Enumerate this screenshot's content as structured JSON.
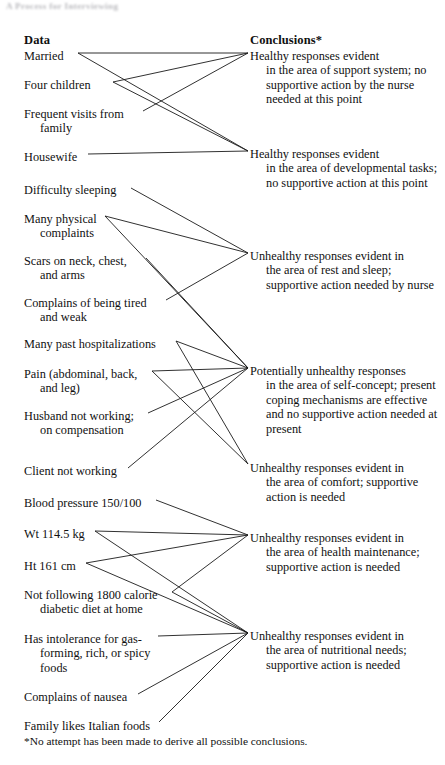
{
  "page": {
    "faded_running_head": "A Process for Interviewing",
    "footnote": "*No attempt has been made to derive all possible conclusions."
  },
  "headers": {
    "data": "Data",
    "conclusions": "Conclusions*"
  },
  "data_items": [
    {
      "id": "married",
      "line1": "Married",
      "cont": "",
      "y": 49,
      "anchor_x": 78,
      "anchor_y": 53
    },
    {
      "id": "four-children",
      "line1": "Four children",
      "cont": "",
      "y": 78,
      "anchor_x": 113,
      "anchor_y": 82
    },
    {
      "id": "frequent-visits",
      "line1": "Frequent visits from",
      "cont": "family",
      "y": 107,
      "anchor_x": 143,
      "anchor_y": 111
    },
    {
      "id": "housewife",
      "line1": "Housewife",
      "cont": "",
      "y": 150,
      "anchor_x": 88,
      "anchor_y": 154
    },
    {
      "id": "difficulty-sleeping",
      "line1": "Difficulty sleeping",
      "cont": "",
      "y": 183,
      "anchor_x": 131,
      "anchor_y": 188
    },
    {
      "id": "many-physical",
      "line1": "Many physical",
      "cont": "complaints",
      "y": 212,
      "anchor_x": 105,
      "anchor_y": 216
    },
    {
      "id": "scars",
      "line1": "Scars on neck, chest,",
      "cont": "and arms",
      "y": 254,
      "anchor_x": 146,
      "anchor_y": 258
    },
    {
      "id": "tired-weak",
      "line1": "Complains of being tired",
      "cont": "and weak",
      "y": 296,
      "anchor_x": 166,
      "anchor_y": 300
    },
    {
      "id": "hospitalizations",
      "line1": "Many past hospitalizations",
      "cont": "",
      "y": 337,
      "anchor_x": 176,
      "anchor_y": 341
    },
    {
      "id": "pain",
      "line1": "Pain (abdominal, back,",
      "cont": "and leg)",
      "y": 367,
      "anchor_x": 152,
      "anchor_y": 371
    },
    {
      "id": "husband-not-working",
      "line1": "Husband not working;",
      "cont": "on compensation",
      "y": 409,
      "anchor_x": 148,
      "anchor_y": 413
    },
    {
      "id": "client-not-working",
      "line1": "Client not working",
      "cont": "",
      "y": 464,
      "anchor_x": 128,
      "anchor_y": 468
    },
    {
      "id": "blood-pressure",
      "line1": "Blood pressure 150/100",
      "cont": "",
      "y": 496,
      "anchor_x": 156,
      "anchor_y": 500
    },
    {
      "id": "weight",
      "line1": "Wt 114.5 kg",
      "cont": "",
      "y": 527,
      "anchor_x": 95,
      "anchor_y": 531
    },
    {
      "id": "height",
      "line1": "Ht 161 cm",
      "cont": "",
      "y": 559,
      "anchor_x": 86,
      "anchor_y": 563
    },
    {
      "id": "diabetic-diet",
      "line1": "Not following 1800 calorie",
      "cont": "diabetic diet at home",
      "y": 588,
      "anchor_x": 172,
      "anchor_y": 592
    },
    {
      "id": "gas-intolerance",
      "line1": "Has intolerance for gas-",
      "cont": "forming, rich, or spicy\nfoods",
      "y": 632,
      "anchor_x": 158,
      "anchor_y": 636
    },
    {
      "id": "nausea",
      "line1": "Complains of nausea",
      "cont": "",
      "y": 690,
      "anchor_x": 138,
      "anchor_y": 694
    },
    {
      "id": "italian-foods",
      "line1": "Family likes Italian foods",
      "cont": "",
      "y": 719,
      "anchor_x": 159,
      "anchor_y": 722
    }
  ],
  "conclusions": [
    {
      "id": "support-system",
      "line1": "Healthy responses evident",
      "cont": "in the area of support system;\nno supportive action by the\nnurse needed at\nthis point",
      "y": 49,
      "anchor_x": 248,
      "anchor_y": 53
    },
    {
      "id": "developmental-tasks",
      "line1": "Healthy responses evident",
      "cont": "in the area of developmental\ntasks; no supportive action\nat this point",
      "y": 147,
      "anchor_x": 248,
      "anchor_y": 151
    },
    {
      "id": "rest-and-sleep",
      "line1": "Unhealthy responses evident in",
      "cont": "the area of rest and sleep;\nsupportive action needed by\nnurse",
      "y": 249,
      "anchor_x": 248,
      "anchor_y": 253
    },
    {
      "id": "self-concept",
      "line1": "Potentially unhealthy responses",
      "cont": "in the area of self-concept;\npresent coping mechanisms\nare effective and no\nsupportive action needed at\npresent",
      "y": 364,
      "anchor_x": 248,
      "anchor_y": 368
    },
    {
      "id": "comfort",
      "line1": "Unhealthy responses evident in",
      "cont": "the area of comfort;\nsupportive action is needed",
      "y": 461,
      "anchor_x": 248,
      "anchor_y": 464
    },
    {
      "id": "health-maintenance",
      "line1": "Unhealthy responses evident in",
      "cont": "the area of health\nmaintenance; supportive\naction is needed",
      "y": 531,
      "anchor_x": 248,
      "anchor_y": 535
    },
    {
      "id": "nutritional-needs",
      "line1": "Unhealthy responses evident in",
      "cont": "the area of nutritional needs;\nsupportive action is needed",
      "y": 629,
      "anchor_x": 248,
      "anchor_y": 633
    }
  ],
  "links": [
    {
      "from": "married",
      "to": "support-system"
    },
    {
      "from": "four-children",
      "to": "support-system"
    },
    {
      "from": "frequent-visits",
      "to": "support-system"
    },
    {
      "from": "married",
      "to": "developmental-tasks"
    },
    {
      "from": "four-children",
      "to": "developmental-tasks"
    },
    {
      "from": "housewife",
      "to": "developmental-tasks"
    },
    {
      "from": "difficulty-sleeping",
      "to": "rest-and-sleep"
    },
    {
      "from": "many-physical",
      "to": "rest-and-sleep"
    },
    {
      "from": "tired-weak",
      "to": "rest-and-sleep"
    },
    {
      "from": "many-physical",
      "to": "self-concept"
    },
    {
      "from": "scars",
      "to": "self-concept"
    },
    {
      "from": "hospitalizations",
      "to": "self-concept"
    },
    {
      "from": "pain",
      "to": "self-concept"
    },
    {
      "from": "husband-not-working",
      "to": "self-concept"
    },
    {
      "from": "hospitalizations",
      "to": "comfort"
    },
    {
      "from": "pain",
      "to": "comfort"
    },
    {
      "from": "client-not-working",
      "to": "self-concept"
    },
    {
      "from": "blood-pressure",
      "to": "health-maintenance"
    },
    {
      "from": "weight",
      "to": "health-maintenance"
    },
    {
      "from": "height",
      "to": "health-maintenance"
    },
    {
      "from": "diabetic-diet",
      "to": "health-maintenance"
    },
    {
      "from": "diabetic-diet",
      "to": "nutritional-needs"
    },
    {
      "from": "gas-intolerance",
      "to": "nutritional-needs"
    },
    {
      "from": "nausea",
      "to": "nutritional-needs"
    },
    {
      "from": "italian-foods",
      "to": "nutritional-needs"
    },
    {
      "from": "weight",
      "to": "nutritional-needs"
    },
    {
      "from": "height",
      "to": "nutritional-needs"
    }
  ],
  "colors": {
    "ink": "#111111",
    "paper": "#ffffff",
    "line": "#1a1a1a"
  }
}
